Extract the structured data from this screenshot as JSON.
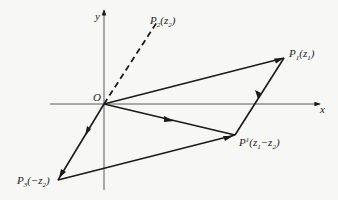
{
  "figure": {
    "axes": {
      "x_label": "x",
      "y_label": "y",
      "origin_label": "O"
    },
    "points": {
      "P1": {
        "name": "P",
        "sub": "1",
        "arg": "(z",
        "arg_sub": "1",
        "close": ")"
      },
      "P2": {
        "name": "P",
        "sub": "2",
        "arg": "(z",
        "arg_sub": "2",
        "close": ")"
      },
      "P3": {
        "name": "P",
        "sub": "3",
        "arg": "(−z",
        "arg_sub": "2",
        "close": ")"
      },
      "Pprime": {
        "name": "P",
        "sup": "1",
        "arg": "(z",
        "arg_sub1": "1",
        "minus": "−z",
        "arg_sub2": "2",
        "close": ")"
      }
    },
    "colors": {
      "ink": "#1a1a1a",
      "background": "#f7f7f5"
    }
  }
}
